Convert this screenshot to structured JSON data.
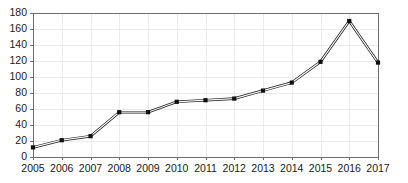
{
  "chart_data": {
    "type": "line",
    "title": "",
    "subtitle": "",
    "xlabel": "",
    "ylabel": "",
    "categories": [
      "2005",
      "2006",
      "2007",
      "2008",
      "2009",
      "2010",
      "2011",
      "2012",
      "2013",
      "2014",
      "2015",
      "2016",
      "2017"
    ],
    "values": [
      12,
      21,
      26,
      56,
      56,
      69,
      71,
      73,
      83,
      93,
      119,
      170,
      118
    ],
    "series": [
      {
        "name": "Series 1",
        "values": [
          12,
          21,
          26,
          56,
          56,
          69,
          71,
          73,
          83,
          93,
          119,
          170,
          118
        ]
      }
    ],
    "ylim": [
      0,
      180
    ],
    "ytick_values": [
      0,
      20,
      40,
      60,
      80,
      100,
      120,
      140,
      160,
      180
    ],
    "ytick_labels": [
      "0",
      "20",
      "40",
      "60",
      "80",
      "100",
      "120",
      "140",
      "160",
      "180"
    ],
    "xtick_labels": [
      "2005",
      "2006",
      "2007",
      "2008",
      "2009",
      "2010",
      "2011",
      "2012",
      "2013",
      "2014",
      "2015",
      "2016",
      "2017"
    ],
    "grid": {
      "horizontal": true,
      "vertical": true,
      "color": "#e2e2e2"
    },
    "legend": {
      "visible": false,
      "position": "none",
      "entries": []
    },
    "annotations": [],
    "colors": {
      "line": "#1c1c1c",
      "line_highlight": "#f2f2f2",
      "marker": "#101010",
      "axis": "#6d6d6d",
      "grid": "#e2e2e2",
      "background": "#ffffff",
      "tick_text": "#1a1a1a"
    },
    "marker_style": "square",
    "plot_area": {
      "left": 33,
      "right": 378,
      "top": 13,
      "bottom": 157
    }
  }
}
